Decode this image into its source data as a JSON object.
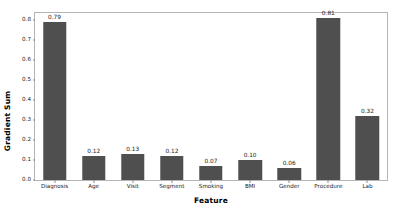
{
  "chart_data": {
    "type": "bar",
    "title": "",
    "xlabel": "Feature",
    "ylabel": "Gradient Sum",
    "categories": [
      "Diagnosis",
      "Age",
      "Visit",
      "Segment",
      "Smoking",
      "BMI",
      "Gender",
      "Procedure",
      "Lab"
    ],
    "values": [
      0.79,
      0.12,
      0.13,
      0.12,
      0.07,
      0.1,
      0.06,
      0.81,
      0.32
    ],
    "value_labels": [
      "0.79",
      "0.12",
      "0.13",
      "0.12",
      "0.07",
      "0.10",
      "0.06",
      "0.81",
      "0.32"
    ],
    "ylim": [
      0.0,
      0.835
    ],
    "yticks": [
      0.0,
      0.1,
      0.2,
      0.3,
      0.4,
      0.5,
      0.6,
      0.7,
      0.8
    ],
    "ytick_labels": [
      "0.0",
      "0.1",
      "0.2",
      "0.3",
      "0.4",
      "0.5",
      "0.6",
      "0.7",
      "0.8"
    ],
    "grid": false,
    "legend": null,
    "bar_color": "#4f4f4f",
    "frame_color": "#b4b4b4",
    "bar_width_fraction": 0.6
  }
}
